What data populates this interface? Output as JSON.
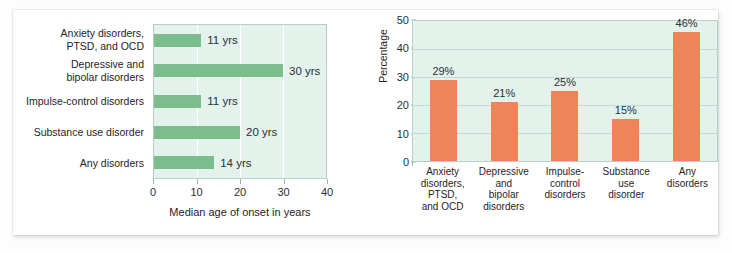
{
  "figure": {
    "background_color": "#fdfdfd",
    "card_color": "#ffffff"
  },
  "chart_data": [
    {
      "type": "bar",
      "orientation": "horizontal",
      "id": "median-age-of-onset",
      "title": "",
      "xlabel": "Median age of onset in years",
      "ylabel": "",
      "xlim": [
        0,
        40
      ],
      "xticks": [
        0,
        10,
        20,
        30,
        40
      ],
      "xtick_labels": [
        "0",
        "10",
        "20",
        "30",
        "40"
      ],
      "grid": true,
      "legend": "none",
      "bar_color": "#7cbd8e",
      "plot_background": "#e4f2ec",
      "unit_suffix": "yrs",
      "categories": [
        "Anxiety disorders,\nPTSD, and OCD",
        "Depressive and\nbipolar disorders",
        "Impulse-control disorders",
        "Substance use disorder",
        "Any disorders"
      ],
      "category_lines": [
        [
          "Anxiety disorders,",
          "PTSD, and OCD"
        ],
        [
          "Depressive and",
          "bipolar disorders"
        ],
        [
          "Impulse-control disorders"
        ],
        [
          "Substance use disorder"
        ],
        [
          "Any disorders"
        ]
      ],
      "values": [
        11,
        30,
        11,
        20,
        14
      ],
      "value_labels": [
        "11 yrs",
        "30 yrs",
        "11 yrs",
        "20 yrs",
        "14 yrs"
      ]
    },
    {
      "type": "bar",
      "orientation": "vertical",
      "id": "lifetime-prevalence",
      "title": "",
      "xlabel": "",
      "ylabel": "Percentage",
      "ylim": [
        0,
        50
      ],
      "yticks": [
        0,
        10,
        20,
        30,
        40,
        50
      ],
      "ytick_labels": [
        "0",
        "10",
        "20",
        "30",
        "40",
        "50"
      ],
      "grid": true,
      "legend": "none",
      "bar_color": "#f08459",
      "plot_background": "#e4f2ec",
      "unit_suffix": "%",
      "categories": [
        "Anxiety disorders, PTSD, and OCD",
        "Depressive and bipolar disorders",
        "Impulse-control disorders",
        "Substance use disorder",
        "Any disorders"
      ],
      "category_lines": [
        [
          "Anxiety",
          "disorders,",
          "PTSD,",
          "and OCD"
        ],
        [
          "Depressive",
          "and",
          "bipolar",
          "disorders"
        ],
        [
          "Impulse-",
          "control",
          "disorders"
        ],
        [
          "Substance",
          "use",
          "disorder"
        ],
        [
          "Any",
          "disorders"
        ]
      ],
      "values": [
        29,
        21,
        25,
        15,
        46
      ],
      "value_labels": [
        "29%",
        "21%",
        "25%",
        "15%",
        "46%"
      ]
    }
  ]
}
